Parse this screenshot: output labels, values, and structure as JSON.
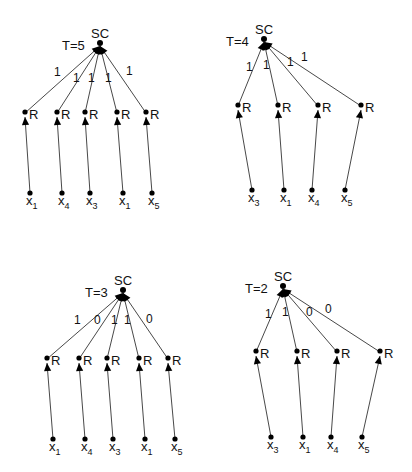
{
  "diagram": {
    "title": "",
    "panels": [
      {
        "id": "panel-t5",
        "root": {
          "label": "SC",
          "t_label": "T=5",
          "x": 100,
          "y": 46
        },
        "relays": [
          {
            "label": "R",
            "x": 25,
            "y": 115,
            "weight": "1"
          },
          {
            "label": "R",
            "x": 57,
            "y": 115,
            "weight": "1"
          },
          {
            "label": "R",
            "x": 85,
            "y": 115,
            "weight": "1"
          },
          {
            "label": "R",
            "x": 117,
            "y": 115,
            "weight": "1"
          },
          {
            "label": "R",
            "x": 146,
            "y": 115,
            "weight": "1"
          }
        ],
        "weight_positions": [
          [
            54,
            76
          ],
          [
            73,
            82
          ],
          [
            88,
            82
          ],
          [
            105,
            82
          ],
          [
            126,
            75
          ]
        ],
        "leaves": [
          {
            "var": "x",
            "sub": "1",
            "x": 30,
            "y": 193
          },
          {
            "var": "x",
            "sub": "4",
            "x": 62,
            "y": 193
          },
          {
            "var": "x",
            "sub": "3",
            "x": 90,
            "y": 193
          },
          {
            "var": "x",
            "sub": "1",
            "x": 123,
            "y": 193
          },
          {
            "var": "x",
            "sub": "5",
            "x": 152,
            "y": 193
          }
        ]
      },
      {
        "id": "panel-t4",
        "root": {
          "label": "SC",
          "t_label": "T=4",
          "x": 264,
          "y": 42
        },
        "relays": [
          {
            "label": "R",
            "x": 238,
            "y": 108,
            "weight": "1"
          },
          {
            "label": "R",
            "x": 278,
            "y": 108,
            "weight": "1"
          },
          {
            "label": "R",
            "x": 318,
            "y": 108,
            "weight": "1"
          },
          {
            "label": "R",
            "x": 361,
            "y": 108,
            "weight": "1"
          }
        ],
        "weight_positions": [
          [
            246,
            71
          ],
          [
            263,
            69
          ],
          [
            287,
            66
          ],
          [
            301,
            61
          ]
        ],
        "leaves": [
          {
            "var": "x",
            "sub": "3",
            "x": 252,
            "y": 190
          },
          {
            "var": "x",
            "sub": "1",
            "x": 284,
            "y": 190
          },
          {
            "var": "x",
            "sub": "4",
            "x": 312,
            "y": 190
          },
          {
            "var": "x",
            "sub": "5",
            "x": 345,
            "y": 190
          }
        ]
      },
      {
        "id": "panel-t3",
        "root": {
          "label": "SC",
          "t_label": "T=3",
          "x": 123,
          "y": 293
        },
        "relays": [
          {
            "label": "R",
            "x": 47,
            "y": 361,
            "weight": "1"
          },
          {
            "label": "R",
            "x": 79,
            "y": 361,
            "weight": "0"
          },
          {
            "label": "R",
            "x": 107,
            "y": 361,
            "weight": "1"
          },
          {
            "label": "R",
            "x": 139,
            "y": 361,
            "weight": "1"
          },
          {
            "label": "R",
            "x": 168,
            "y": 361,
            "weight": "0"
          }
        ],
        "weight_positions": [
          [
            74,
            324
          ],
          [
            94,
            324
          ],
          [
            111,
            324
          ],
          [
            124,
            324
          ],
          [
            146,
            323
          ]
        ],
        "leaves": [
          {
            "var": "x",
            "sub": "1",
            "x": 53,
            "y": 439
          },
          {
            "var": "x",
            "sub": "4",
            "x": 85,
            "y": 439
          },
          {
            "var": "x",
            "sub": "3",
            "x": 113,
            "y": 439
          },
          {
            "var": "x",
            "sub": "1",
            "x": 145,
            "y": 439
          },
          {
            "var": "x",
            "sub": "5",
            "x": 175,
            "y": 439
          }
        ]
      },
      {
        "id": "panel-t2",
        "root": {
          "label": "SC",
          "t_label": "T=2",
          "x": 283,
          "y": 289
        },
        "relays": [
          {
            "label": "R",
            "x": 256,
            "y": 354,
            "weight": "1"
          },
          {
            "label": "R",
            "x": 297,
            "y": 354,
            "weight": "1"
          },
          {
            "label": "R",
            "x": 337,
            "y": 354,
            "weight": "0"
          },
          {
            "label": "R",
            "x": 380,
            "y": 354,
            "weight": "0"
          }
        ],
        "weight_positions": [
          [
            265,
            318
          ],
          [
            282,
            316
          ],
          [
            306,
            316
          ],
          [
            325,
            313
          ]
        ],
        "leaves": [
          {
            "var": "x",
            "sub": "3",
            "x": 271,
            "y": 437
          },
          {
            "var": "x",
            "sub": "1",
            "x": 303,
            "y": 437
          },
          {
            "var": "x",
            "sub": "4",
            "x": 331,
            "y": 437
          },
          {
            "var": "x",
            "sub": "5",
            "x": 362,
            "y": 437
          }
        ]
      }
    ],
    "style": {
      "edge_color": "#333333",
      "node_color": "#000000",
      "background": "#ffffff"
    }
  }
}
